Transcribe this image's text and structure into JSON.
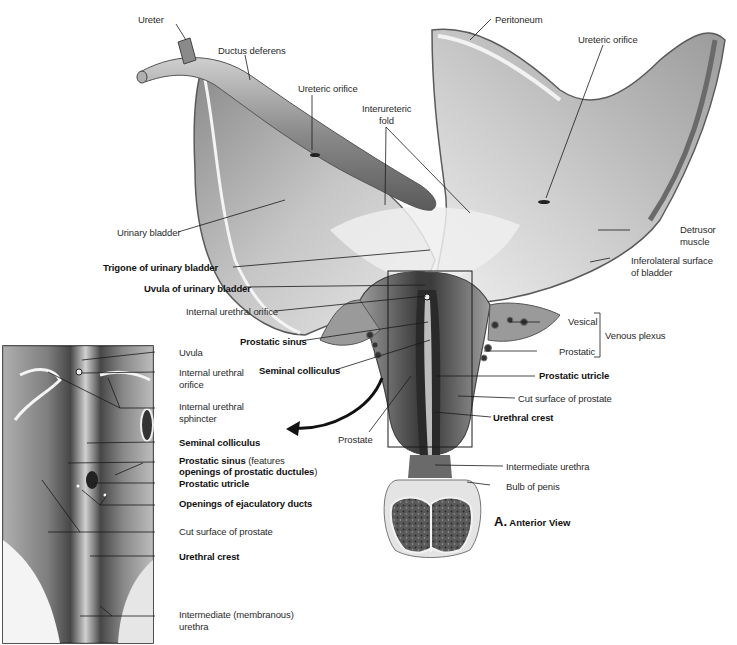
{
  "figure": {
    "caption_letter": "A.",
    "caption_text": "Anterior View"
  },
  "main_labels": {
    "ureter": "Ureter",
    "ductus_deferens": "Ductus deferens",
    "ureteric_orifice_left": "Ureteric orifice",
    "interureteric_fold_line1": "Interureteric",
    "interureteric_fold_line2": "fold",
    "peritoneum": "Peritoneum",
    "ureteric_orifice_right": "Ureteric orifice",
    "urinary_bladder": "Urinary bladder",
    "detrusor_muscle_line1": "Detrusor",
    "detrusor_muscle_line2": "muscle",
    "inferolateral_surface_line1": "Inferolateral surface",
    "inferolateral_surface_line2": "of bladder",
    "trigone": "Trigone of urinary bladder",
    "uvula": "Uvula of urinary bladder",
    "internal_urethral_orifice": "Internal urethral orifice",
    "prostatic_sinus": "Prostatic sinus",
    "vesical": "Vesical",
    "venous_plexus": "Venous plexus",
    "prostatic": "Prostatic",
    "seminal_colliculus": "Seminal colliculus",
    "prostatic_utricle": "Prostatic utricle",
    "cut_surface_prostate": "Cut surface of prostate",
    "urethral_crest": "Urethral crest",
    "prostate": "Prostate",
    "intermediate_urethra": "Intermediate urethra",
    "bulb_of_penis": "Bulb of penis"
  },
  "inset_labels": {
    "uvula": "Uvula",
    "internal_urethral_orifice_line1": "Internal urethral",
    "internal_urethral_orifice_line2": "orifice",
    "internal_urethral_sphincter_line1": "Internal urethral",
    "internal_urethral_sphincter_line2": "sphincter",
    "seminal_colliculus": "Seminal colliculus",
    "prostatic_sinus_bold": "Prostatic sinus",
    "prostatic_sinus_note": " (features",
    "prostatic_sinus_line2_bold": "openings of prostatic ductules",
    "prostatic_sinus_line2_end": ")",
    "prostatic_utricle": "Prostatic utricle",
    "openings_ejaculatory_ducts": "Openings of ejaculatory ducts",
    "cut_surface_prostate": "Cut surface of prostate",
    "urethral_crest": "Urethral crest",
    "intermediate_urethra_line1": "Intermediate (membranous)",
    "intermediate_urethra_line2": "urethra"
  },
  "colors": {
    "background": "#ffffff",
    "tissue_light": "#d9d9d9",
    "tissue_mid": "#a8a8a8",
    "tissue_dark": "#4a4a4a",
    "leader_line": "#1a1a1a"
  }
}
